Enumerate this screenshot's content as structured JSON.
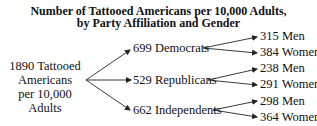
{
  "title": {
    "line1": "Number of Tattooed Americans per 10,000 Adults,",
    "line2": "by Party Affiliation and Gender"
  },
  "root": {
    "line1": "1890 Tattooed",
    "line2": "Americans",
    "line3": "per 10,000 Adults",
    "value": 1890
  },
  "parties": [
    {
      "label": "699 Democrats",
      "value": 699,
      "name": "Democrats",
      "genders": [
        {
          "label": "315 Men",
          "value": 315
        },
        {
          "label": "384 Women",
          "value": 384
        }
      ]
    },
    {
      "label": "529 Republicans",
      "value": 529,
      "name": "Republicans",
      "genders": [
        {
          "label": "238 Men",
          "value": 238
        },
        {
          "label": "291 Women",
          "value": 291
        }
      ]
    },
    {
      "label": "662 Independents",
      "value": 662,
      "name": "Independents",
      "genders": [
        {
          "label": "298 Men",
          "value": 298
        },
        {
          "label": "364 Women",
          "value": 364
        }
      ]
    }
  ]
}
